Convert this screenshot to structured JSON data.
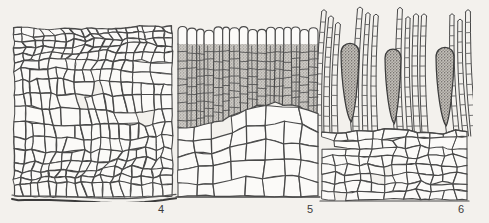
{
  "plate": {
    "title": "Anatomical plate of algal thallus sections",
    "background_color": "#f3f1ed",
    "ink_color": "#4a4a4a",
    "stipple_color": "#b9b7b3",
    "width": 489,
    "height": 223
  },
  "panels": [
    {
      "id": "panel-4",
      "label": "4",
      "label_x": 158,
      "label_y": 203,
      "caption_text": "4",
      "bounds": {
        "x": 14,
        "y": 28,
        "w": 158,
        "h": 168
      },
      "description": "Surface view of cortical cell network, irregular polygonal cells, wavy basal margin",
      "cell_style": "polygonal-network",
      "shaded": false,
      "rows": 17,
      "cols": 17
    },
    {
      "id": "panel-5",
      "label": "5",
      "label_x": 307,
      "label_y": 203,
      "caption_text": "5",
      "bounds": {
        "x": 178,
        "y": 26,
        "w": 140,
        "h": 170
      },
      "description": "Transverse section: palisade cap row, shaded small-celled cortex above larger clear medullary cells",
      "cell_style": "stratified",
      "shaded": true,
      "shade_top": 44,
      "shade_bottom": 120,
      "palisade_count": 16,
      "cortex_rows": 9,
      "medulla_rows": 5
    },
    {
      "id": "panel-6",
      "label": "6",
      "label_x": 458,
      "label_y": 203,
      "caption_text": "6",
      "bounds": {
        "x": 322,
        "y": 10,
        "w": 145,
        "h": 190
      },
      "description": "Longitudinal section through sorus: clavate stippled sporangia among multicellular paraphyses, over cortical tissue",
      "cell_style": "sorus",
      "shaded": true,
      "sporangia_count": 3,
      "paraphyses_count": 13,
      "base_top": 130
    }
  ],
  "sporangia": [
    {
      "name": "sporangium-left",
      "cx": 350,
      "top": 40,
      "bottom": 122,
      "rx": 9
    },
    {
      "name": "sporangium-middle",
      "cx": 393,
      "top": 46,
      "bottom": 124,
      "rx": 8
    },
    {
      "name": "sporangium-right",
      "cx": 445,
      "top": 44,
      "bottom": 126,
      "rx": 9
    }
  ],
  "legend": {
    "figure_numbers": [
      "4",
      "5",
      "6"
    ]
  }
}
